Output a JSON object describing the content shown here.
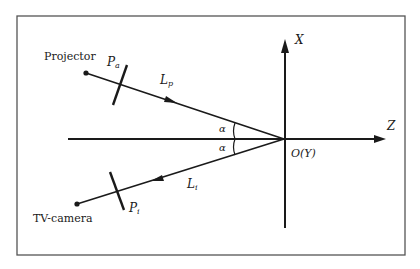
{
  "diagram": {
    "labels": {
      "projector": "Projector",
      "tv_camera": "TV-camera",
      "pa_main": "P",
      "pa_sub": "a",
      "pi_main": "P",
      "pi_sub": "i",
      "lp_main": "L",
      "lp_sub": "p",
      "li_main": "L",
      "li_sub": "i",
      "axis_x": "X",
      "axis_z": "Z",
      "origin": "O(Y)",
      "alpha_upper": "α",
      "alpha_lower": "α"
    },
    "colors": {
      "stroke": "#1a1a1a",
      "frame": "#555555",
      "background": "#ffffff"
    }
  }
}
